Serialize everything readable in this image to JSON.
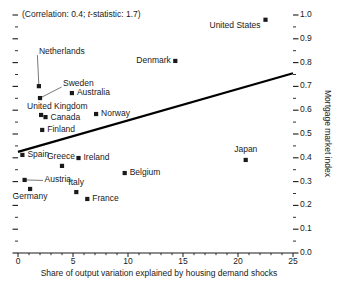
{
  "chart_data": {
    "type": "scatter",
    "title": "",
    "subtitle": "",
    "annotation": "(Correlation: 0.4; t-statistic: 1.7)",
    "annotation_prefix": "(Correlation: 0.4; ",
    "annotation_italic": "t",
    "annotation_suffix": "-statistic: 1.7)",
    "correlation": 0.4,
    "t_statistic": 1.7,
    "xlabel": "Share of output variation explained by housing demand shocks",
    "ylabel": "Mortgage market index",
    "xlim": [
      0,
      25
    ],
    "ylim": [
      0.0,
      1.0
    ],
    "xticks": [
      "0",
      "5",
      "10",
      "15",
      "20",
      "25"
    ],
    "xtick_values": [
      0,
      5,
      10,
      15,
      20,
      25
    ],
    "x_minor_step": 1,
    "yticks": [
      "0.0",
      "0.1",
      "0.2",
      "0.3",
      "0.4",
      "0.5",
      "0.6",
      "0.7",
      "0.8",
      "0.9",
      "1.0"
    ],
    "ytick_values": [
      0.0,
      0.1,
      0.2,
      0.3,
      0.4,
      0.5,
      0.6,
      0.7,
      0.8,
      0.9,
      1.0
    ],
    "y_minor_step": 0.05,
    "grid": false,
    "legend": "none",
    "y_axis_position": "right",
    "marker_shape": "square",
    "marker_color": "#1a1a1a",
    "trendline": {
      "label": "regression line",
      "x0": 0.0,
      "y0": 0.425,
      "x1": 25.0,
      "y1": 0.755,
      "color": "#000000",
      "width": 2.2
    },
    "points": [
      {
        "name": "United States",
        "x": 22.5,
        "y": 0.98,
        "label_dx": -5,
        "label_dy": 9,
        "label_anchor": "end"
      },
      {
        "name": "Denmark",
        "x": 14.3,
        "y": 0.807,
        "label_dx": -5,
        "label_dy": 3,
        "label_anchor": "end"
      },
      {
        "name": "Netherlands",
        "x": 1.9,
        "y": 0.701,
        "label_dx": 0,
        "label_dy": -31,
        "label_anchor": "start",
        "leader": true
      },
      {
        "name": "Sweden",
        "x": 2.0,
        "y": 0.651,
        "label_dx": 23,
        "label_dy": -11,
        "label_anchor": "start",
        "leader": true
      },
      {
        "name": "Australia",
        "x": 4.9,
        "y": 0.672,
        "label_dx": 5,
        "label_dy": 3,
        "label_anchor": "start"
      },
      {
        "name": "United Kingdom",
        "x": 2.1,
        "y": 0.58,
        "label_dx": -14,
        "label_dy": -5,
        "label_anchor": "start"
      },
      {
        "name": "Canada",
        "x": 2.5,
        "y": 0.571,
        "label_dx": 5,
        "label_dy": 4,
        "label_anchor": "start"
      },
      {
        "name": "Norway",
        "x": 7.1,
        "y": 0.584,
        "label_dx": 5,
        "label_dy": 3,
        "label_anchor": "start"
      },
      {
        "name": "Finland",
        "x": 2.2,
        "y": 0.517,
        "label_dx": 5,
        "label_dy": 3,
        "label_anchor": "start"
      },
      {
        "name": "Spain",
        "x": 0.4,
        "y": 0.412,
        "label_dx": 5,
        "label_dy": 3,
        "label_anchor": "start"
      },
      {
        "name": "Greece",
        "x": 4.0,
        "y": 0.366,
        "label_dx": -1,
        "label_dy": -6,
        "label_anchor": "middle"
      },
      {
        "name": "Ireland",
        "x": 5.5,
        "y": 0.399,
        "label_dx": 5,
        "label_dy": 3,
        "label_anchor": "start"
      },
      {
        "name": "Japan",
        "x": 20.7,
        "y": 0.391,
        "label_dx": 0,
        "label_dy": -7,
        "label_anchor": "middle"
      },
      {
        "name": "Belgium",
        "x": 9.7,
        "y": 0.336,
        "label_dx": 5,
        "label_dy": 3,
        "label_anchor": "start"
      },
      {
        "name": "Austria",
        "x": 0.6,
        "y": 0.307,
        "label_dx": 20,
        "label_dy": 3,
        "label_anchor": "start",
        "leader": true
      },
      {
        "name": "Germany",
        "x": 1.1,
        "y": 0.269,
        "label_dx": 0,
        "label_dy": 11,
        "label_anchor": "middle"
      },
      {
        "name": "Italy",
        "x": 5.3,
        "y": 0.256,
        "label_dx": 0,
        "label_dy": -6,
        "label_anchor": "middle"
      },
      {
        "name": "France",
        "x": 6.3,
        "y": 0.227,
        "label_dx": 5,
        "label_dy": 3,
        "label_anchor": "start"
      }
    ]
  },
  "geometry": {
    "plot_left": 18,
    "plot_right": 293,
    "plot_top": 15,
    "plot_bottom": 253
  }
}
